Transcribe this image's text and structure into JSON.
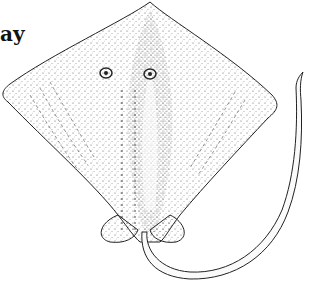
{
  "caption": "ay",
  "illustration": {
    "subject": "ray (dorsal view), stippled pen drawing",
    "ink_color": "#222222",
    "background": "#ffffff"
  }
}
